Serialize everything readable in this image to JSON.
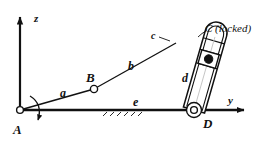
{
  "figure": {
    "background_color": "#ffffff",
    "line_color": "#111111",
    "centerline_color": "#bdbdbd"
  },
  "axes": {
    "vertical": {
      "label": "z",
      "name": "z-axis",
      "direction": "up",
      "origin": {
        "x": 20,
        "y": 110
      },
      "tip": {
        "x": 20,
        "y": 13
      }
    },
    "horizontal": {
      "label": "y",
      "name": "y-axis",
      "direction": "right",
      "origin": {
        "x": 20,
        "y": 110
      },
      "tip": {
        "x": 248,
        "y": 110
      }
    }
  },
  "points": [
    {
      "id": "A",
      "label": "A",
      "x": 20,
      "y": 110,
      "type": "pivot-joint",
      "note": "ground pivot at origin"
    },
    {
      "id": "B",
      "label": "B",
      "x": 94,
      "y": 89,
      "type": "pin-joint",
      "note": "joint between links a and b"
    },
    {
      "id": "C",
      "label": "C",
      "x": 176,
      "y": 43,
      "type": "locked-joint",
      "note": "slider block, locked"
    },
    {
      "id": "D",
      "label": "D",
      "x": 194,
      "y": 110,
      "type": "pivot-joint",
      "note": "ground pivot on y-axis"
    }
  ],
  "links": [
    {
      "id": "a",
      "label": "a",
      "from": "A",
      "to": "B",
      "label_x": 60,
      "label_y": 97
    },
    {
      "id": "b",
      "label": "b",
      "from": "B",
      "to": "C",
      "label_x": 128,
      "label_y": 68
    },
    {
      "id": "c",
      "label": "c",
      "from": "C",
      "to": "slider-top",
      "label_x": 156,
      "label_y": 36
    },
    {
      "id": "d",
      "label": "d",
      "from": "C",
      "to": "D",
      "label_x": 186,
      "label_y": 80
    },
    {
      "id": "e",
      "label": "e",
      "from": "A",
      "to": "D",
      "label_x": 137,
      "label_y": 105
    }
  ],
  "annotations": {
    "locked_label": "C (locked)",
    "locked_label_x": 206,
    "locked_label_y": 33,
    "rotation_arrow": {
      "name": "rotation-arrow-at-A",
      "description": "curved arrow indicating input rotation about A"
    },
    "ground_hatching": {
      "name": "ground-hatching",
      "description": "hatch marks below link e denoting fixed ground"
    }
  },
  "slider": {
    "name": "slider-body",
    "top_cap": "rounded",
    "angle_deg": -15,
    "segments": 3
  }
}
